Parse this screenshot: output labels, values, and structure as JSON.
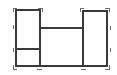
{
  "diagram": {
    "type": "wireframe-layout",
    "width": 117,
    "height": 75,
    "colors": {
      "line": "#3a3a3a",
      "marker": "#6a6a6a",
      "background": "#ffffff"
    },
    "shapes": [
      {
        "id": "left-box",
        "kind": "rect",
        "x": 16,
        "y": 10,
        "w": 24,
        "h": 56
      },
      {
        "id": "right-box",
        "kind": "rect",
        "x": 83,
        "y": 11,
        "w": 24,
        "h": 55
      },
      {
        "id": "left-box-divider",
        "kind": "line",
        "x1": 16,
        "y1": 49,
        "x2": 40,
        "y2": 49
      },
      {
        "id": "middle-top-line",
        "kind": "line",
        "x1": 40,
        "y1": 28,
        "x2": 83,
        "y2": 28
      },
      {
        "id": "bottom-line",
        "kind": "line",
        "x1": 40,
        "y1": 66,
        "x2": 83,
        "y2": 66
      }
    ],
    "corner_marks": [
      {
        "id": "tl-left",
        "x": 13,
        "y": 8,
        "dir": "tl"
      },
      {
        "id": "tr-left",
        "x": 42,
        "y": 8,
        "dir": "tr"
      },
      {
        "id": "tl-right",
        "x": 80,
        "y": 8,
        "dir": "tl"
      },
      {
        "id": "tr-right",
        "x": 109,
        "y": 8,
        "dir": "tr"
      },
      {
        "id": "bl",
        "x": 13,
        "y": 69,
        "dir": "bl"
      },
      {
        "id": "br",
        "x": 109,
        "y": 69,
        "dir": "br"
      }
    ],
    "tick_marks": [
      {
        "id": "left-tick-1",
        "x1": 13,
        "y1": 25,
        "x2": 13,
        "y2": 29
      },
      {
        "id": "left-tick-2",
        "x1": 13,
        "y1": 48,
        "x2": 13,
        "y2": 52
      },
      {
        "id": "right-tick-1",
        "x1": 110,
        "y1": 26,
        "x2": 110,
        "y2": 30
      },
      {
        "id": "right-tick-2",
        "x1": 110,
        "y1": 48,
        "x2": 110,
        "y2": 52
      },
      {
        "id": "bottom-tick-1",
        "x1": 37,
        "y1": 69,
        "x2": 42,
        "y2": 69
      },
      {
        "id": "bottom-tick-2",
        "x1": 81,
        "y1": 69,
        "x2": 86,
        "y2": 69
      }
    ]
  }
}
